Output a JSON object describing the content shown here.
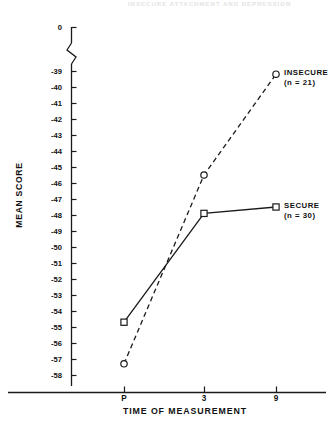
{
  "header": {
    "running_text": "INSECURE ATTACHMENT AND DEPRESSION"
  },
  "chart_data": {
    "type": "line",
    "title": "",
    "xlabel": "TIME OF MEASUREMENT",
    "ylabel": "MEAN SCORE",
    "x": [
      "P",
      "3",
      "9"
    ],
    "xtick_labels": [
      "P",
      "3",
      "9"
    ],
    "ytick_labels": [
      "0",
      "-39",
      "-40",
      "-41",
      "-42",
      "-43",
      "-44",
      "-45",
      "-46",
      "-47",
      "-48",
      "-49",
      "-50",
      "-51",
      "-52",
      "-53",
      "-54",
      "-55",
      "-56",
      "-57",
      "-58"
    ],
    "ylim": [
      -58,
      -39
    ],
    "y_axis_break": true,
    "y_axis_break_label": "0",
    "grid": false,
    "legend_position": "inline-right",
    "series": [
      {
        "name": "INSECURE",
        "n_label": "(n = 21)",
        "n": 21,
        "marker": "open-circle",
        "line_style": "dashed",
        "color": "#1a1a1a",
        "values": [
          -57.3,
          -45.5,
          -39.2
        ]
      },
      {
        "name": "SECURE",
        "n_label": "(n = 30)",
        "n": 30,
        "marker": "open-square",
        "line_style": "solid",
        "color": "#1a1a1a",
        "values": [
          -54.7,
          -47.9,
          -47.5
        ]
      }
    ]
  },
  "annotations": {
    "insecure_label": "INSECURE",
    "insecure_n": "(n = 21)",
    "secure_label": "SECURE",
    "secure_n": "(n = 30)"
  },
  "yticks": [
    {
      "label": "0",
      "y": 27
    },
    {
      "label": "-39",
      "y": 71
    },
    {
      "label": "-40",
      "y": 87
    },
    {
      "label": "-41",
      "y": 103
    },
    {
      "label": "-42",
      "y": 119
    },
    {
      "label": "-43",
      "y": 135
    },
    {
      "label": "-44",
      "y": 151
    },
    {
      "label": "-45",
      "y": 167
    },
    {
      "label": "-46",
      "y": 183
    },
    {
      "label": "-47",
      "y": 199
    },
    {
      "label": "-48",
      "y": 215
    },
    {
      "label": "-49",
      "y": 231
    },
    {
      "label": "-50",
      "y": 247
    },
    {
      "label": "-51",
      "y": 263
    },
    {
      "label": "-52",
      "y": 279
    },
    {
      "label": "-53",
      "y": 295
    },
    {
      "label": "-54",
      "y": 311
    },
    {
      "label": "-55",
      "y": 327
    },
    {
      "label": "-56",
      "y": 343
    },
    {
      "label": "-57",
      "y": 359
    },
    {
      "label": "-58",
      "y": 375
    }
  ],
  "xticks": [
    {
      "label": "P",
      "x": 124
    },
    {
      "label": "3",
      "x": 204
    },
    {
      "label": "9",
      "x": 276
    }
  ]
}
